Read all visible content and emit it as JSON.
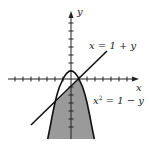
{
  "diagram": {
    "type": "region-between-curves",
    "axes": {
      "x_label": "x",
      "y_label": "y",
      "tick_spacing_units": 1,
      "x_range": [
        -8,
        8.4
      ],
      "y_range": [
        -7.5,
        8.4
      ]
    },
    "curves": [
      {
        "id": "line",
        "equation_label": "x = 1 + y",
        "equation_lhs": "x = 1 + y"
      },
      {
        "id": "parabola",
        "equation_label_base": "x",
        "equation_label_exp": "2",
        "equation_label_rest": " = 1 − y"
      }
    ],
    "intersections": [
      [
        1,
        0
      ],
      [
        -2,
        -3
      ]
    ],
    "shaded_region": "inside parabola x² = 1 − y and below line x = 1 + y",
    "colors": {
      "fill": "#9a9a9a",
      "stroke": "#111111",
      "axis": "#222222"
    }
  }
}
